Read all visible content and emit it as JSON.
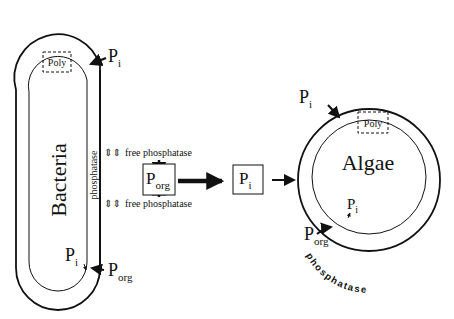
{
  "bacteria": {
    "label": "Bacteria",
    "membrane_label": "phosphatase",
    "poly_label": "Poly",
    "pi_top": {
      "main": "P",
      "sub": "i"
    },
    "pi_bottom": {
      "main": "P",
      "sub": "i"
    },
    "porg_bottom": {
      "main": "P",
      "sub": "org"
    }
  },
  "free_phosphatase": {
    "top": {
      "arrows": "⇕⇕",
      "text": "free  phosphatase"
    },
    "bottom": {
      "arrows": "⇕⇕",
      "text": "free  phosphatase"
    }
  },
  "center": {
    "porg_box": {
      "main": "P",
      "sub": "org"
    },
    "pi_box": {
      "main": "P",
      "sub": "i"
    }
  },
  "algae": {
    "label": "Algae",
    "poly_label": "Poly",
    "membrane_label": "phosphatase",
    "pi_top": {
      "main": "P",
      "sub": "i"
    },
    "pi_inner": {
      "main": "P",
      "sub": "i"
    },
    "porg_bottom": {
      "main": "P",
      "sub": "org"
    }
  },
  "colors": {
    "stroke": "#111111",
    "background": "#ffffff"
  }
}
